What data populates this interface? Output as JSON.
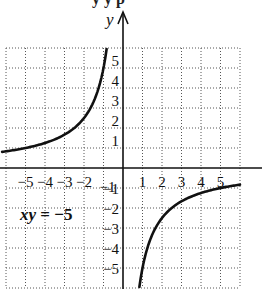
{
  "chart_data": {
    "type": "line",
    "title": "",
    "equation_label": "xy = −5",
    "function": "y = -5/x",
    "xlabel": "",
    "ylabel": "y",
    "xlim": [
      -6,
      6
    ],
    "ylim": [
      -6,
      6
    ],
    "grid": true,
    "grid_style": "dotted",
    "x_ticks": [
      -5,
      -4,
      -3,
      -2,
      -1,
      1,
      2,
      3,
      4,
      5
    ],
    "x_tick_labels": [
      "−5",
      "−4",
      "−3",
      "−2",
      "−1",
      "1",
      "2",
      "3",
      "4",
      "5"
    ],
    "y_ticks": [
      5,
      4,
      3,
      2,
      1,
      -1,
      -2,
      -3,
      -4,
      -5
    ],
    "y_tick_labels": [
      "5",
      "4",
      "3",
      "2",
      "1",
      "−1",
      "−2",
      "−3",
      "−4",
      "−5"
    ],
    "series": [
      {
        "name": "left branch (x < 0)",
        "x": [
          -6,
          -5,
          -4,
          -3,
          -2.5,
          -2,
          -1.5,
          -1.25,
          -1,
          -0.9,
          -0.83
        ],
        "y": [
          0.83,
          1,
          1.25,
          1.67,
          2,
          2.5,
          3.33,
          4,
          5,
          5.56,
          6
        ]
      },
      {
        "name": "right branch (x > 0)",
        "x": [
          0.83,
          0.9,
          1,
          1.25,
          1.5,
          2,
          2.5,
          3,
          4,
          5,
          6
        ],
        "y": [
          -6,
          -5.56,
          -5,
          -4,
          -3.33,
          -2.5,
          -2,
          -1.67,
          -1.25,
          -1,
          -0.83
        ]
      }
    ]
  },
  "labels": {
    "y_axis": "y",
    "equation_lhs": "xy",
    "equation_rhs": " = −5",
    "title_fragment": "y    y p"
  }
}
